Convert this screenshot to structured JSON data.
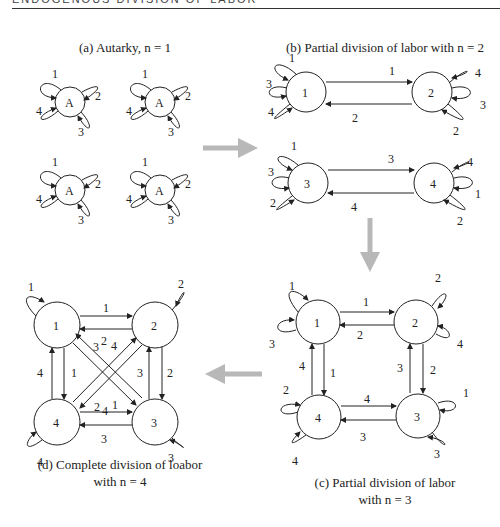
{
  "header": {
    "running_head": "ENDOGENOUS DIVISION OF LABOR"
  },
  "panels": {
    "a": {
      "caption": "(a) Autarky, n = 1",
      "node_label": "A",
      "loop_labels": [
        "1",
        "2",
        "3",
        "4"
      ]
    },
    "b": {
      "caption": "(b) Partial division of labor with n = 2",
      "nodes": [
        "1",
        "2",
        "3",
        "4"
      ],
      "edges": [
        {
          "from": "1",
          "to": "2",
          "label": "1"
        },
        {
          "from": "2",
          "to": "1",
          "label": "2"
        },
        {
          "from": "3",
          "to": "4",
          "label": "3"
        },
        {
          "from": "4",
          "to": "3",
          "label": "4"
        }
      ],
      "loops": {
        "1": [
          "1",
          "3",
          "4"
        ],
        "2": [
          "4",
          "3",
          "2"
        ],
        "3": [
          "1",
          "3",
          "2"
        ],
        "4": [
          "4",
          "1",
          "2"
        ]
      }
    },
    "c": {
      "caption_line1": "(c) Partial division of labor",
      "caption_line2": "with n = 3",
      "nodes": [
        "1",
        "2",
        "3",
        "4"
      ],
      "edges": [
        {
          "from": "1",
          "to": "2",
          "label": "1"
        },
        {
          "from": "2",
          "to": "1",
          "label": "2"
        },
        {
          "from": "2",
          "to": "3",
          "label": "2"
        },
        {
          "from": "3",
          "to": "2",
          "label": "3"
        },
        {
          "from": "4",
          "to": "3",
          "label": "4"
        },
        {
          "from": "3",
          "to": "4",
          "label": "3"
        },
        {
          "from": "1",
          "to": "4",
          "label": "1"
        },
        {
          "from": "4",
          "to": "1",
          "label": "4"
        }
      ],
      "loops": {
        "1": [
          "1",
          "3"
        ],
        "2": [
          "2",
          "4"
        ],
        "3": [
          "1",
          "3"
        ],
        "4": [
          "2",
          "4"
        ]
      }
    },
    "d": {
      "caption_line1": "(d) Complete division of loabor",
      "caption_line2": "with n = 4",
      "nodes": [
        "1",
        "2",
        "3",
        "4"
      ],
      "edges": [
        {
          "from": "1",
          "to": "2",
          "label": "1"
        },
        {
          "from": "2",
          "to": "1",
          "label": "2"
        },
        {
          "from": "2",
          "to": "3",
          "label": "2"
        },
        {
          "from": "3",
          "to": "2",
          "label": "3"
        },
        {
          "from": "4",
          "to": "3",
          "label": "4"
        },
        {
          "from": "3",
          "to": "4",
          "label": "3"
        },
        {
          "from": "1",
          "to": "4",
          "label": "1"
        },
        {
          "from": "4",
          "to": "1",
          "label": "4"
        },
        {
          "from": "1",
          "to": "3",
          "label": "1"
        },
        {
          "from": "3",
          "to": "1",
          "label": "3"
        },
        {
          "from": "2",
          "to": "4",
          "label": "2"
        },
        {
          "from": "4",
          "to": "2",
          "label": "4"
        }
      ],
      "loops": {
        "1": [
          "1"
        ],
        "2": [
          "2"
        ],
        "3": [
          "3"
        ],
        "4": [
          "4"
        ]
      }
    }
  },
  "arrows": {
    "color": "#b8b8b8",
    "sequence": [
      "a→b",
      "b→c",
      "c→d"
    ]
  }
}
